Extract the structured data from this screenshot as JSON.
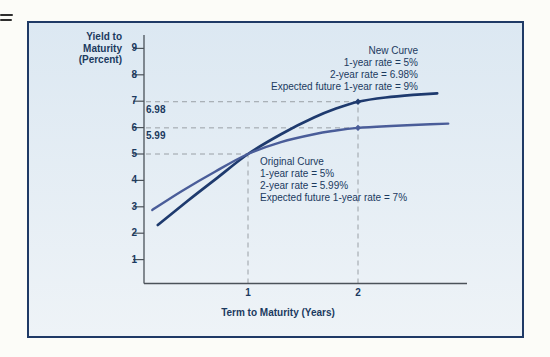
{
  "colors": {
    "page_bg": "#fcfcf8",
    "panel_border": "#1f3a66",
    "panel_bg_top": "#dce8f2",
    "panel_bg_bottom": "#eef3f7",
    "text": "#1b3a5f",
    "axis": "#4b5259",
    "guide": "#9aa0a6",
    "new_curve": "#1e3a6e",
    "original_curve": "#4a5d99"
  },
  "chart_data": {
    "type": "line",
    "x_axis": {
      "label": "Term to Maturity (Years)",
      "ticks": [
        1,
        2
      ],
      "range": [
        0,
        3
      ]
    },
    "y_axis": {
      "label_lines": [
        "Yield to",
        "Maturity",
        "(Percent)"
      ],
      "ticks": [
        1,
        2,
        3,
        4,
        5,
        6,
        7,
        8,
        9
      ],
      "range": [
        0,
        9.5
      ]
    },
    "series": [
      {
        "name": "New Curve",
        "color": "#1e3a6e",
        "points": [
          [
            0.18,
            2.31
          ],
          [
            0.45,
            3.22
          ],
          [
            0.7,
            4.03
          ],
          [
            1.0,
            5.0
          ],
          [
            1.3,
            5.75
          ],
          [
            1.6,
            6.38
          ],
          [
            1.8,
            6.72
          ],
          [
            2.0,
            6.98
          ],
          [
            2.25,
            7.14
          ],
          [
            2.5,
            7.24
          ],
          [
            2.72,
            7.3
          ]
        ]
      },
      {
        "name": "Original Curve",
        "color": "#4a5d99",
        "points": [
          [
            0.13,
            2.88
          ],
          [
            0.4,
            3.6
          ],
          [
            0.7,
            4.33
          ],
          [
            1.0,
            5.0
          ],
          [
            1.3,
            5.45
          ],
          [
            1.6,
            5.75
          ],
          [
            1.8,
            5.89
          ],
          [
            2.0,
            5.99
          ],
          [
            2.3,
            6.06
          ],
          [
            2.55,
            6.11
          ],
          [
            2.82,
            6.15
          ]
        ]
      }
    ],
    "markers": [
      {
        "x": 2,
        "y": 6.98,
        "series": "New Curve"
      },
      {
        "x": 2,
        "y": 5.99,
        "series": "Original Curve"
      }
    ],
    "guides": [
      {
        "type": "h",
        "y": 6.98,
        "to_x": 2
      },
      {
        "type": "h",
        "y": 5.99,
        "to_x": 2
      },
      {
        "type": "h",
        "y": 5.0,
        "to_x": 1
      },
      {
        "type": "v",
        "x": 1,
        "to_y": 5.0
      },
      {
        "type": "v",
        "x": 2,
        "to_y": 6.98
      }
    ],
    "guide_labels": [
      "6.98",
      "5.99"
    ],
    "annotations": {
      "new_curve": {
        "title": "New Curve",
        "lines": [
          "1-year rate = 5%",
          "2-year rate = 6.98%",
          "Expected future 1-year rate = 9%"
        ]
      },
      "original_curve": {
        "title": "Original Curve",
        "lines": [
          "1-year rate = 5%",
          "2-year rate = 5.99%",
          "Expected future 1-year rate = 7%"
        ]
      }
    },
    "intersection": {
      "x": 1,
      "y": 5.0
    }
  }
}
